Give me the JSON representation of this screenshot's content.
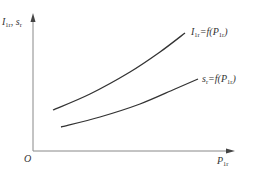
{
  "chart_data": {
    "type": "line",
    "title": "",
    "xlabel": "P_1r",
    "ylabel": "I_1r, s_r",
    "origin_label": "O",
    "grid": false,
    "ticks": "none",
    "series": [
      {
        "name": "I_1r = f(P_1r)",
        "label_main": "I",
        "label_sub": "1r",
        "label_eq": "=f(",
        "label_arg": "P",
        "label_arg_sub": "1r",
        "label_close": ")",
        "shape": "increasing, slightly convex",
        "points_px": [
          [
            53,
            110
          ],
          [
            90,
            94
          ],
          [
            130,
            72
          ],
          [
            160,
            52
          ],
          [
            185,
            33
          ]
        ]
      },
      {
        "name": "s_r = f(P_1r)",
        "label_main": "s",
        "label_sub": "r",
        "label_eq": "=f(",
        "label_arg": "P",
        "label_arg_sub": "1r",
        "label_close": ")",
        "shape": "increasing, gently convex",
        "points_px": [
          [
            61,
            127
          ],
          [
            100,
            117
          ],
          [
            140,
            104
          ],
          [
            175,
            89
          ],
          [
            198,
            79
          ]
        ]
      }
    ]
  },
  "axes": {
    "y_label_main": "I",
    "y_label_sub": "1r",
    "y_label_sep": ", ",
    "y_label_main2": "s",
    "y_label_sub2": "r",
    "x_label_main": "P",
    "x_label_sub": "1r",
    "origin": "O"
  },
  "colors": {
    "axis": "#888888",
    "curve": "#333333",
    "text": "#333333"
  }
}
